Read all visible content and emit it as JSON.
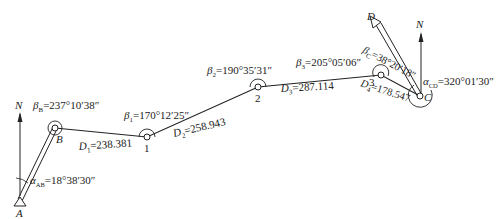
{
  "diagram": {
    "type": "traverse-survey",
    "colors": {
      "line": "#222222",
      "background": "#ffffff"
    },
    "north_label": "N",
    "points": {
      "A": {
        "label": "A"
      },
      "B": {
        "label": "B"
      },
      "P1": {
        "label": "1"
      },
      "P2": {
        "label": "2"
      },
      "P3": {
        "label": "3"
      },
      "C": {
        "label": "C"
      },
      "D": {
        "label": "D"
      }
    },
    "angles": {
      "beta_B": {
        "sym": "β",
        "sub": "B",
        "value": "=237°10′38″"
      },
      "beta_1": {
        "sym": "β",
        "sub": "1",
        "value": "=170°12′25″"
      },
      "beta_2": {
        "sym": "β",
        "sub": "2",
        "value": "=190°35′31″"
      },
      "beta_3": {
        "sym": "β",
        "sub": "3",
        "value": "=205°05′06″"
      },
      "beta_C": {
        "sym": "β",
        "sub": "C",
        "value": "=38°20′18″"
      },
      "alpha_AB": {
        "sym": "α",
        "sub": "AB",
        "value": "=18°38′30″"
      },
      "alpha_CD": {
        "sym": "α",
        "sub": "CD",
        "value": "=320°01′30″"
      }
    },
    "distances": {
      "D1": {
        "sym": "D",
        "sub": "1",
        "value": "=238.381"
      },
      "D2": {
        "sym": "D",
        "sub": "2",
        "value": "=258.943"
      },
      "D3": {
        "sym": "D",
        "sub": "3",
        "value": "=287.114"
      },
      "D4": {
        "sym": "D",
        "sub": "4",
        "value": "=178.547"
      }
    }
  }
}
